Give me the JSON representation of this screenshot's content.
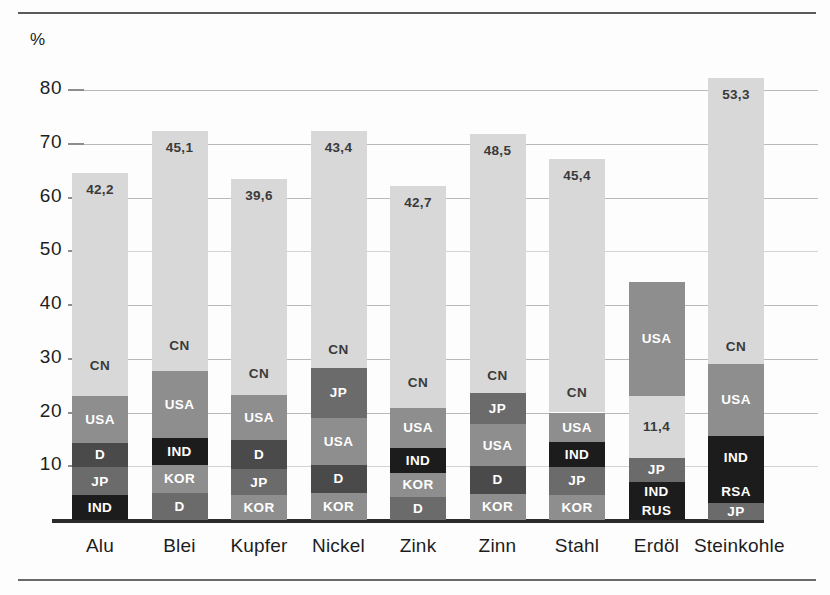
{
  "axis": {
    "unit_label": "%",
    "ticks": [
      80,
      70,
      60,
      50,
      40,
      30,
      20,
      10
    ],
    "tick_labels": [
      "80",
      "70",
      "60",
      "50",
      "40",
      "30",
      "20",
      "10"
    ]
  },
  "colors": {
    "light": "#d8d8d8",
    "medium": "#b0b0b0",
    "mid_dark": "#8e8e8e",
    "dark": "#6b6b6b",
    "darker": "#4a4a4a",
    "black": "#1c1c1c",
    "gridline": "#b9b9b9",
    "baseline": "#2b2b2b",
    "label_dark": "#3a3a3a",
    "label_light": "#ffffff"
  },
  "chart_data": {
    "type": "bar",
    "subtype": "stacked",
    "title": "",
    "xlabel": "",
    "ylabel": "%",
    "ylim": [
      0,
      85
    ],
    "grid": true,
    "legend": "none (segments labelled in place)",
    "categories": [
      "Alu",
      "Blei",
      "Kupfer",
      "Nickel",
      "Zink",
      "Zinn",
      "Stahl",
      "Erdöl",
      "Steinkohle"
    ],
    "totals": [
      64.6,
      72.4,
      63.4,
      72.4,
      62.2,
      71.9,
      67.2,
      44.3,
      82.3
    ],
    "total_labels": [
      "42,2",
      "45,1",
      "39,6",
      "43,4",
      "42,7",
      "48,5",
      "45,4",
      "",
      "53,3"
    ],
    "bars": [
      {
        "category": "Alu",
        "top_label": "42,2",
        "segments": [
          {
            "name": "IND",
            "label": "IND",
            "value": 4.6,
            "tone": "black"
          },
          {
            "name": "JP",
            "label": "JP",
            "value": 5.2,
            "tone": "dark"
          },
          {
            "name": "D",
            "label": "D",
            "value": 4.6,
            "tone": "darker"
          },
          {
            "name": "USA",
            "label": "USA",
            "value": 8.6,
            "tone": "mid_dark"
          },
          {
            "name": "CN",
            "label": "CN",
            "value": 11.4,
            "tone": "light"
          },
          {
            "name": "TOP",
            "label": "",
            "value": 30.2,
            "tone": "light"
          }
        ]
      },
      {
        "category": "Blei",
        "top_label": "45,1",
        "segments": [
          {
            "name": "D",
            "label": "D",
            "value": 5.0,
            "tone": "dark"
          },
          {
            "name": "KOR",
            "label": "KOR",
            "value": 5.2,
            "tone": "mid_dark"
          },
          {
            "name": "IND",
            "label": "IND",
            "value": 5.0,
            "tone": "black"
          },
          {
            "name": "USA",
            "label": "USA",
            "value": 12.5,
            "tone": "mid_dark"
          },
          {
            "name": "CN",
            "label": "CN",
            "value": 9.3,
            "tone": "light"
          },
          {
            "name": "TOP",
            "label": "",
            "value": 35.4,
            "tone": "light"
          }
        ]
      },
      {
        "category": "Kupfer",
        "top_label": "39,6",
        "segments": [
          {
            "name": "KOR",
            "label": "KOR",
            "value": 4.6,
            "tone": "mid_dark"
          },
          {
            "name": "JP",
            "label": "JP",
            "value": 4.8,
            "tone": "dark"
          },
          {
            "name": "D",
            "label": "D",
            "value": 5.4,
            "tone": "darker"
          },
          {
            "name": "USA",
            "label": "USA",
            "value": 8.4,
            "tone": "mid_dark"
          },
          {
            "name": "CN",
            "label": "CN",
            "value": 8.0,
            "tone": "light"
          },
          {
            "name": "TOP",
            "label": "",
            "value": 32.2,
            "tone": "light"
          }
        ]
      },
      {
        "category": "Nickel",
        "top_label": "43,4",
        "segments": [
          {
            "name": "KOR",
            "label": "KOR",
            "value": 5.1,
            "tone": "mid_dark"
          },
          {
            "name": "D",
            "label": "D",
            "value": 5.2,
            "tone": "darker"
          },
          {
            "name": "USA",
            "label": "USA",
            "value": 8.6,
            "tone": "mid_dark"
          },
          {
            "name": "JP",
            "label": "JP",
            "value": 9.4,
            "tone": "dark"
          },
          {
            "name": "CN",
            "label": "CN",
            "value": 6.7,
            "tone": "light"
          },
          {
            "name": "TOP",
            "label": "",
            "value": 37.4,
            "tone": "light"
          }
        ]
      },
      {
        "category": "Zink",
        "top_label": "42,7",
        "segments": [
          {
            "name": "D",
            "label": "D",
            "value": 4.3,
            "tone": "dark"
          },
          {
            "name": "KOR",
            "label": "KOR",
            "value": 4.5,
            "tone": "mid_dark"
          },
          {
            "name": "IND",
            "label": "IND",
            "value": 4.6,
            "tone": "black"
          },
          {
            "name": "USA",
            "label": "USA",
            "value": 7.5,
            "tone": "mid_dark"
          },
          {
            "name": "CN",
            "label": "CN",
            "value": 9.2,
            "tone": "light"
          },
          {
            "name": "TOP",
            "label": "",
            "value": 32.1,
            "tone": "light"
          }
        ]
      },
      {
        "category": "Zinn",
        "top_label": "48,5",
        "segments": [
          {
            "name": "KOR",
            "label": "KOR",
            "value": 4.9,
            "tone": "mid_dark"
          },
          {
            "name": "D",
            "label": "D",
            "value": 5.1,
            "tone": "darker"
          },
          {
            "name": "USA",
            "label": "USA",
            "value": 7.8,
            "tone": "mid_dark"
          },
          {
            "name": "JP",
            "label": "JP",
            "value": 5.8,
            "tone": "dark"
          },
          {
            "name": "CN",
            "label": "CN",
            "value": 6.4,
            "tone": "light"
          },
          {
            "name": "TOP",
            "label": "",
            "value": 41.9,
            "tone": "light"
          }
        ]
      },
      {
        "category": "Stahl",
        "top_label": "45,4",
        "segments": [
          {
            "name": "KOR",
            "label": "KOR",
            "value": 4.7,
            "tone": "mid_dark"
          },
          {
            "name": "JP",
            "label": "JP",
            "value": 5.2,
            "tone": "dark"
          },
          {
            "name": "IND",
            "label": "IND",
            "value": 4.6,
            "tone": "black"
          },
          {
            "name": "USA",
            "label": "USA",
            "value": 5.5,
            "tone": "mid_dark"
          },
          {
            "name": "CN",
            "label": "CN",
            "value": 7.2,
            "tone": "light"
          },
          {
            "name": "TOP",
            "label": "",
            "value": 39.9,
            "tone": "light"
          }
        ]
      },
      {
        "category": "Erdöl",
        "top_label": "",
        "segments": [
          {
            "name": "RUS",
            "label": "RUS",
            "value": 3.4,
            "tone": "black"
          },
          {
            "name": "IND",
            "label": "IND",
            "value": 3.7,
            "tone": "black"
          },
          {
            "name": "JP",
            "label": "JP",
            "value": 4.5,
            "tone": "dark"
          },
          {
            "name": "CN",
            "label": "CN",
            "value": 11.4,
            "tone": "light",
            "value_label": "11,4"
          },
          {
            "name": "USA",
            "label": "USA",
            "value": 21.3,
            "tone": "mid_dark"
          }
        ]
      },
      {
        "category": "Steinkohle",
        "top_label": "53,3",
        "segments": [
          {
            "name": "JP",
            "label": "JP",
            "value": 3.2,
            "tone": "dark"
          },
          {
            "name": "RSA",
            "label": "RSA",
            "value": 4.2,
            "tone": "black"
          },
          {
            "name": "IND",
            "label": "IND",
            "value": 8.2,
            "tone": "black"
          },
          {
            "name": "USA",
            "label": "USA",
            "value": 13.4,
            "tone": "mid_dark"
          },
          {
            "name": "CN",
            "label": "CN",
            "value": 6.4,
            "tone": "light"
          },
          {
            "name": "TOP",
            "label": "",
            "value": 46.9,
            "tone": "light"
          }
        ]
      }
    ]
  }
}
